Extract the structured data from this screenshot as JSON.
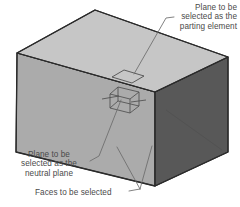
{
  "diagram": {
    "title_labels": {
      "parting": {
        "lines": [
          "Plane to be",
          "selected as the",
          "parting element"
        ],
        "text": "Plane to be\nselected as the\nparting element"
      },
      "neutral": {
        "lines": [
          "Plane to be",
          "selected as the",
          "neutral plane"
        ],
        "text": "Plane to be\nselected as the\nneutral plane"
      },
      "faces": {
        "lines": [
          "Faces to be selected"
        ],
        "text": "Faces to be selected"
      }
    },
    "colors": {
      "top_face": "#c6c6c6",
      "front_face": "#ababab",
      "right_face": "#585858",
      "outline": "#2b2b2b",
      "leader_line": "#6b6b6b",
      "text": "#4a4a4a",
      "background": "#ffffff",
      "symbol_stroke": "#4f4f4f"
    },
    "shapes": {
      "box": {
        "name": "rectangular-block",
        "top_face": "95,10 228,57 155,92 17,53",
        "front_face": "17,53 155,92 155,186 16,152",
        "right_face": "155,92 228,57 228,152 155,186"
      },
      "parting_plane_symbol": {
        "name": "parting-plane-parallelogram",
        "points": "124,70 144,76 132,83 112,77"
      },
      "neutral_plane_symbol": {
        "name": "neutral-plane-datum",
        "top_quad": "118,87 139,92 130,99 110,94",
        "bottom_quad": "118,101 139,106 130,113 110,108",
        "left_edge": "110,94 110,108",
        "right_edge": "139,92 139,106",
        "front_edge": "130,99 130,113",
        "back_edge": "118,87 118,101",
        "cross_h_left": "103,98 118,96",
        "cross_h_right": "132,101 144,100"
      }
    },
    "leaders": [
      {
        "name": "leader-parting",
        "path": "M 172,17 L 165,18 L 134,74"
      },
      {
        "name": "leader-neutral",
        "path": "M 93,160 L 99,156 L 122,99"
      },
      {
        "name": "leader-faces-stem",
        "path": "M 130,191 L 139,190"
      },
      {
        "name": "leader-faces-branch-left",
        "path": "M 139,190 L 117,147"
      },
      {
        "name": "leader-faces-branch-right",
        "path": "M 139,190 L 151,144"
      }
    ]
  }
}
